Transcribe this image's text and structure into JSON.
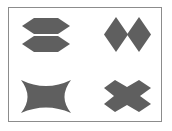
{
  "figure": {
    "frame_color": "#8c8c8c",
    "fill_color": "#5f5f5f",
    "shapes": [
      {
        "id": "top-left",
        "name": "double-hexagon-stack",
        "description": "two stacked hexagons"
      },
      {
        "id": "top-right",
        "name": "double-diamond",
        "description": "two adjacent diamonds"
      },
      {
        "id": "bottom-left",
        "name": "four-point-concave-star",
        "description": "four-pointed star with concave sides"
      },
      {
        "id": "bottom-right",
        "name": "x-cross",
        "description": "X-shaped cross"
      }
    ]
  }
}
